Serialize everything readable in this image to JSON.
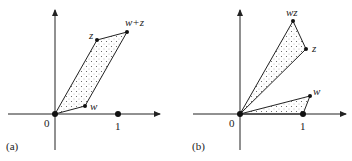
{
  "panels": [
    {
      "id": "a",
      "caption": "(a)",
      "origin_label": "0",
      "unit_label": "1",
      "points": [
        {
          "name": "z",
          "label": "z"
        },
        {
          "name": "w+z",
          "label": "w+z"
        },
        {
          "name": "w",
          "label": "w"
        }
      ],
      "shape": "parallelogram 0, w, w+z, z (dotted fill)"
    },
    {
      "id": "b",
      "caption": "(b)",
      "origin_label": "0",
      "unit_label": "1",
      "points": [
        {
          "name": "wz",
          "label": "wz"
        },
        {
          "name": "z",
          "label": "z"
        },
        {
          "name": "w",
          "label": "w"
        }
      ],
      "shape": "similar triangles 0-1-w and 0-z-wz (dotted fill)"
    }
  ],
  "colors": {
    "ink": "#222222",
    "fill_dots": "#555555"
  }
}
